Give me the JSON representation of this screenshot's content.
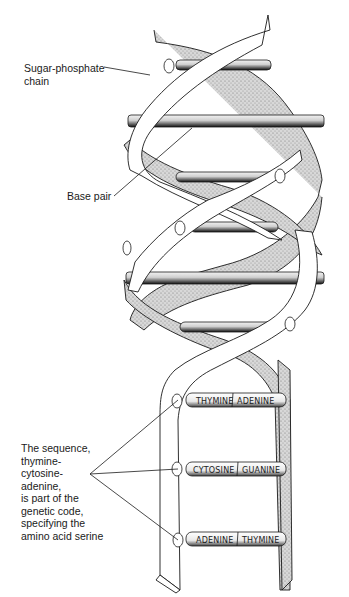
{
  "diagram": {
    "labels": {
      "sugar_phosphate": [
        "Sugar-phosphate",
        "chain"
      ],
      "base_pair": "Base pair",
      "sequence_note": [
        "The sequence,",
        "thymine-",
        "cytosine-",
        "adenine,",
        "is part of the",
        "genetic code,",
        "specifying the",
        "amino acid serine"
      ]
    },
    "base_pairs": [
      {
        "left": "THYMINE",
        "right": "ADENINE"
      },
      {
        "left": "CYTOSINE",
        "right": "GUANINE"
      },
      {
        "left": "ADENINE",
        "right": "THYMINE"
      }
    ],
    "colors": {
      "ink": "#1a1a1a",
      "shade": "#9a9a9a",
      "background": "#ffffff"
    }
  }
}
